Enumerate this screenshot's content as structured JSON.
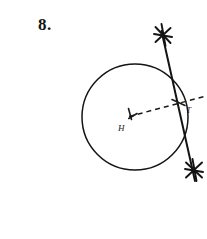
{
  "problem": {
    "number": "8."
  },
  "figure": {
    "type": "geometry-construction",
    "labels": {
      "center": "H",
      "tangent_point": "T"
    },
    "circle": {
      "cx": 135,
      "cy": 117,
      "r": 53,
      "stroke": "#141414"
    },
    "tangent_line": {
      "x1": 162,
      "y1": 33,
      "x2": 194,
      "y2": 180,
      "stroke": "#141414",
      "style": "solid"
    },
    "radius_dashed": {
      "x1": 131,
      "y1": 116,
      "x2": 207,
      "y2": 96,
      "stroke": "#1a1a1a",
      "style": "dashed"
    },
    "arc_marks": [
      {
        "name": "upper-arc-mark",
        "cx": 163,
        "cy": 35
      },
      {
        "name": "lower-arc-mark",
        "cx": 194,
        "cy": 170
      }
    ],
    "center_tick": {
      "cx": 131,
      "cy": 116
    },
    "tangent_tick": {
      "cx": 178,
      "cy": 103
    }
  },
  "colors": {
    "ink": "#141414",
    "paper": "#ffffff"
  }
}
